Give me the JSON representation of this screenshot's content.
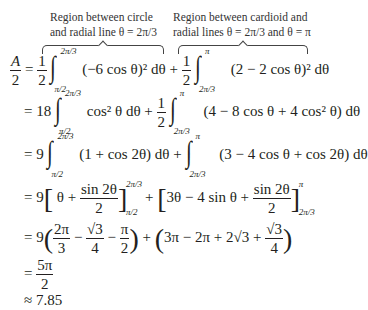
{
  "annotations": {
    "left": {
      "line1": "Region between circle",
      "line2": "and radial line θ = 2π/3"
    },
    "right": {
      "line1": "Region between cardioid and",
      "line2": "radial lines θ = 2π/3 and θ = π"
    }
  },
  "lines": [
    {
      "lhs_num": "A",
      "lhs_den": "2",
      "eq": "=",
      "t1_coef_num": "1",
      "t1_coef_den": "2",
      "t1_upper": "2π/3",
      "t1_lower": "π/2",
      "t1_integrand": "(−6 cos θ)² dθ",
      "plus": "+",
      "t2_coef_num": "1",
      "t2_coef_den": "2",
      "t2_upper": "π",
      "t2_lower": "2π/3",
      "t2_integrand": "(2 − 2 cos θ)² dθ"
    },
    {
      "eq": "=",
      "t1_coef": "18",
      "t1_upper": "2π/3",
      "t1_lower": "π/2",
      "t1_integrand": "cos² θ dθ",
      "plus": "+",
      "t2_coef_num": "1",
      "t2_coef_den": "2",
      "t2_upper": "π",
      "t2_lower": "2π/3",
      "t2_integrand": "(4 − 8 cos θ + 4 cos² θ) dθ"
    },
    {
      "eq": "=",
      "t1_coef": "9",
      "t1_upper": "2π/3",
      "t1_lower": "π/2",
      "t1_integrand": "(1 + cos 2θ) dθ",
      "plus": "+",
      "t2_upper": "π",
      "t2_lower": "2π/3",
      "t2_integrand": "(3 − 4 cos θ + cos 2θ) dθ"
    },
    {
      "eq": "=",
      "coef": "9",
      "b1_a": "θ +",
      "b1_num": "sin 2θ",
      "b1_den": "2",
      "b1_upper": "2π/3",
      "b1_lower": "π/2",
      "plus": "+",
      "b2_a": "3θ − 4 sin θ +",
      "b2_num": "sin 2θ",
      "b2_den": "2",
      "b2_upper": "π",
      "b2_lower": "2π/3"
    },
    {
      "eq": "=",
      "coef": "9",
      "p1_f1_num": "2π",
      "p1_f1_den": "3",
      "minus": "−",
      "p1_f2_num": "√3",
      "p1_f2_den": "4",
      "p1_f3_num": "π",
      "p1_f3_den": "2",
      "plus": "+",
      "p2_a": "3π − 2π + 2√3 +",
      "p2_f_num": "√3",
      "p2_f_den": "4"
    },
    {
      "eq": "=",
      "num": "5π",
      "den": "2"
    },
    {
      "eq": "≈",
      "value": "7.85"
    }
  ]
}
